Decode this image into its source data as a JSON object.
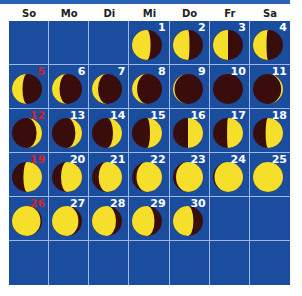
{
  "weekdays": [
    "So",
    "Mo",
    "Di",
    "Mi",
    "Do",
    "Fr",
    "Sa"
  ],
  "colors": {
    "background": "#1b4d9e",
    "lit": "#f5df2a",
    "dark": "#3a0d0d",
    "sunday": "#d3242a",
    "gridline": "#9cb8e6"
  },
  "first_weekday_index": 3,
  "days": [
    {
      "day": "1",
      "lit": 0.62,
      "side": "left"
    },
    {
      "day": "2",
      "lit": 0.55,
      "side": "left"
    },
    {
      "day": "3",
      "lit": 0.5,
      "side": "left"
    },
    {
      "day": "4",
      "lit": 0.45,
      "side": "left"
    },
    {
      "day": "5",
      "lit": 0.35,
      "side": "left"
    },
    {
      "day": "6",
      "lit": 0.25,
      "side": "left"
    },
    {
      "day": "7",
      "lit": 0.2,
      "side": "left"
    },
    {
      "day": "8",
      "lit": 0.17,
      "side": "left"
    },
    {
      "day": "9",
      "lit": 0.05,
      "side": "left"
    },
    {
      "day": "10",
      "lit": 0.0,
      "side": "left"
    },
    {
      "day": "11",
      "lit": 0.06,
      "side": "right"
    },
    {
      "day": "12",
      "lit": 0.18,
      "side": "right"
    },
    {
      "day": "13",
      "lit": 0.22,
      "side": "right"
    },
    {
      "day": "14",
      "lit": 0.3,
      "side": "right"
    },
    {
      "day": "15",
      "lit": 0.4,
      "side": "right"
    },
    {
      "day": "16",
      "lit": 0.5,
      "side": "right"
    },
    {
      "day": "17",
      "lit": 0.53,
      "side": "right"
    },
    {
      "day": "18",
      "lit": 0.58,
      "side": "right"
    },
    {
      "day": "19",
      "lit": 0.62,
      "side": "right"
    },
    {
      "day": "20",
      "lit": 0.7,
      "side": "right"
    },
    {
      "day": "21",
      "lit": 0.78,
      "side": "right"
    },
    {
      "day": "22",
      "lit": 0.85,
      "side": "right"
    },
    {
      "day": "23",
      "lit": 0.9,
      "side": "right"
    },
    {
      "day": "24",
      "lit": 0.95,
      "side": "right"
    },
    {
      "day": "25",
      "lit": 1.0,
      "side": "right"
    },
    {
      "day": "26",
      "lit": 0.95,
      "side": "left"
    },
    {
      "day": "27",
      "lit": 0.88,
      "side": "left"
    },
    {
      "day": "28",
      "lit": 0.8,
      "side": "left"
    },
    {
      "day": "29",
      "lit": 0.75,
      "side": "left"
    },
    {
      "day": "30",
      "lit": 0.68,
      "side": "left"
    }
  ]
}
